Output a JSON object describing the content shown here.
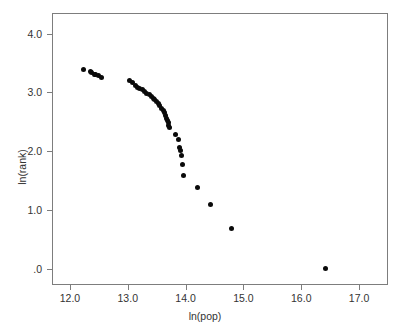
{
  "chart_data": {
    "type": "scatter",
    "title": "",
    "xlabel": "ln(pop)",
    "ylabel": "ln(rank)",
    "xlim": [
      11.69,
      17.5
    ],
    "ylim": [
      -0.27,
      4.35
    ],
    "grid": false,
    "legend": null,
    "xticks": [
      12.0,
      13.0,
      14.0,
      15.0,
      16.0,
      17.0
    ],
    "xtick_labels": [
      "12.0",
      "13.0",
      "14.0",
      "15.0",
      "16.0",
      "17.0"
    ],
    "yticks": [
      0.0,
      1.0,
      2.0,
      3.0,
      4.0
    ],
    "ytick_labels": [
      ".0",
      "1.0",
      "2.0",
      "3.0",
      "4.0"
    ],
    "marker": "filled-circle",
    "marker_color": "#0a0a0a",
    "marker_size_px": 5,
    "points": [
      {
        "x": 12.21,
        "y": 3.4
      },
      {
        "x": 12.33,
        "y": 3.37
      },
      {
        "x": 12.36,
        "y": 3.35
      },
      {
        "x": 12.4,
        "y": 3.33
      },
      {
        "x": 12.43,
        "y": 3.32
      },
      {
        "x": 12.47,
        "y": 3.3
      },
      {
        "x": 12.52,
        "y": 3.27
      },
      {
        "x": 13.01,
        "y": 3.22
      },
      {
        "x": 13.07,
        "y": 3.19
      },
      {
        "x": 13.11,
        "y": 3.14
      },
      {
        "x": 13.15,
        "y": 3.11
      },
      {
        "x": 13.19,
        "y": 3.09
      },
      {
        "x": 13.23,
        "y": 3.06
      },
      {
        "x": 13.27,
        "y": 3.03
      },
      {
        "x": 13.31,
        "y": 3.0
      },
      {
        "x": 13.35,
        "y": 2.98
      },
      {
        "x": 13.39,
        "y": 2.95
      },
      {
        "x": 13.42,
        "y": 2.92
      },
      {
        "x": 13.45,
        "y": 2.89
      },
      {
        "x": 13.48,
        "y": 2.86
      },
      {
        "x": 13.51,
        "y": 2.83
      },
      {
        "x": 13.54,
        "y": 2.79
      },
      {
        "x": 13.57,
        "y": 2.75
      },
      {
        "x": 13.6,
        "y": 2.71
      },
      {
        "x": 13.62,
        "y": 2.67
      },
      {
        "x": 13.64,
        "y": 2.62
      },
      {
        "x": 13.66,
        "y": 2.58
      },
      {
        "x": 13.67,
        "y": 2.54
      },
      {
        "x": 13.68,
        "y": 2.5
      },
      {
        "x": 13.69,
        "y": 2.46
      },
      {
        "x": 13.7,
        "y": 2.42
      },
      {
        "x": 13.8,
        "y": 2.31
      },
      {
        "x": 13.86,
        "y": 2.21
      },
      {
        "x": 13.88,
        "y": 2.09
      },
      {
        "x": 13.9,
        "y": 2.03
      },
      {
        "x": 13.91,
        "y": 1.95
      },
      {
        "x": 13.93,
        "y": 1.8
      },
      {
        "x": 13.95,
        "y": 1.61
      },
      {
        "x": 14.18,
        "y": 1.4
      },
      {
        "x": 14.41,
        "y": 1.12
      },
      {
        "x": 14.78,
        "y": 0.71
      },
      {
        "x": 16.41,
        "y": 0.03
      }
    ]
  }
}
